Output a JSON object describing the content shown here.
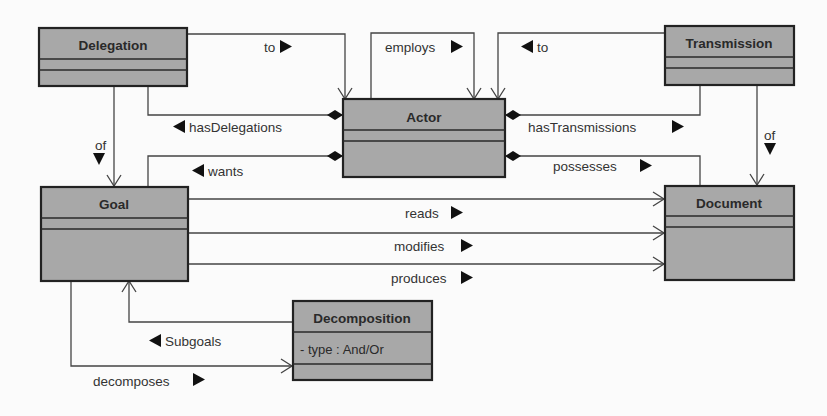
{
  "diagram": {
    "type": "UML class diagram",
    "classes": [
      {
        "id": "delegation",
        "name": "Delegation",
        "attributes": []
      },
      {
        "id": "actor",
        "name": "Actor",
        "attributes": []
      },
      {
        "id": "transmission",
        "name": "Transmission",
        "attributes": []
      },
      {
        "id": "goal",
        "name": "Goal",
        "attributes": []
      },
      {
        "id": "document",
        "name": "Document",
        "attributes": []
      },
      {
        "id": "decomposition",
        "name": "Decomposition",
        "attributes": [
          "- type : And/Or"
        ]
      }
    ],
    "associations": [
      {
        "label": "to",
        "from": "delegation",
        "to": "actor",
        "direction": "right"
      },
      {
        "label": "employs",
        "from": "actor",
        "to": "actor",
        "direction": "right"
      },
      {
        "label": "to",
        "from": "transmission",
        "to": "actor",
        "direction": "left"
      },
      {
        "label": "hasDelegations",
        "from": "actor",
        "to": "delegation",
        "direction": "left",
        "composition": true
      },
      {
        "label": "hasTransmissions",
        "from": "actor",
        "to": "transmission",
        "direction": "right",
        "composition": true
      },
      {
        "label": "wants",
        "from": "actor",
        "to": "goal",
        "direction": "left",
        "composition": true
      },
      {
        "label": "possesses",
        "from": "actor",
        "to": "document",
        "direction": "right",
        "composition": true
      },
      {
        "label": "of",
        "from": "delegation",
        "to": "goal",
        "direction": "down"
      },
      {
        "label": "of",
        "from": "transmission",
        "to": "document",
        "direction": "down"
      },
      {
        "label": "reads",
        "from": "goal",
        "to": "document",
        "direction": "right"
      },
      {
        "label": "modifies",
        "from": "goal",
        "to": "document",
        "direction": "right"
      },
      {
        "label": "produces",
        "from": "goal",
        "to": "document",
        "direction": "right"
      },
      {
        "label": "Subgoals",
        "from": "decomposition",
        "to": "goal",
        "direction": "left"
      },
      {
        "label": "decomposes",
        "from": "goal",
        "to": "decomposition",
        "direction": "right"
      }
    ]
  },
  "colors": {
    "class_fill": "#a8a8a8",
    "border": "#222222",
    "background": "#fbfbfb"
  }
}
